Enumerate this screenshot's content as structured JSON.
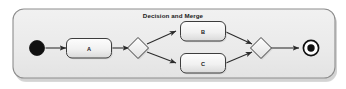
{
  "diagram": {
    "title": "Decision and Merge",
    "type": "uml-activity-diagram",
    "container": {
      "fill": "#eceded",
      "border": "#8d8d8d"
    },
    "nodes": {
      "start": {
        "name": "start-node",
        "label": "",
        "shape": "filled-circle",
        "color": "#111111"
      },
      "a": {
        "name": "activity-a",
        "label": "A",
        "shape": "rounded-rectangle"
      },
      "decision": {
        "name": "decision-node",
        "label": "",
        "shape": "diamond"
      },
      "b": {
        "name": "activity-b",
        "label": "B",
        "shape": "rounded-rectangle"
      },
      "c": {
        "name": "activity-c",
        "label": "C",
        "shape": "rounded-rectangle"
      },
      "merge": {
        "name": "merge-node",
        "label": "",
        "shape": "diamond"
      },
      "end": {
        "name": "end-node",
        "label": "",
        "shape": "bullseye-circle",
        "color": "#111111"
      }
    },
    "edges": [
      {
        "from": "start",
        "to": "a",
        "label": ""
      },
      {
        "from": "a",
        "to": "decision",
        "label": ""
      },
      {
        "from": "decision",
        "to": "b",
        "label": ""
      },
      {
        "from": "decision",
        "to": "c",
        "label": ""
      },
      {
        "from": "b",
        "to": "merge",
        "label": ""
      },
      {
        "from": "c",
        "to": "merge",
        "label": ""
      },
      {
        "from": "merge",
        "to": "end",
        "label": ""
      }
    ],
    "colors": {
      "stroke": "#3d3d3d",
      "node_fill_top": "#fbfbfb",
      "node_fill_bottom": "#dedede",
      "edge": "#2b2b2b"
    }
  }
}
